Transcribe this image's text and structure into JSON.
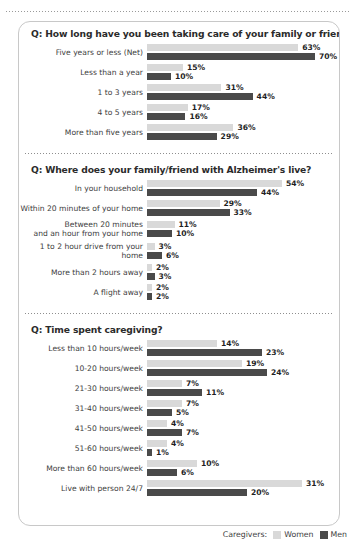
{
  "legend": {
    "prefix": "Caregivers:",
    "items": [
      {
        "label": "Women",
        "color": "#d9d9d9",
        "key": "women"
      },
      {
        "label": "Men",
        "color": "#4a4a4a",
        "key": "men"
      }
    ]
  },
  "chart_data": {
    "type": "bar",
    "title": "",
    "orientation": "horizontal",
    "series": [
      {
        "name": "Women",
        "color": "#d9d9d9"
      },
      {
        "name": "Men",
        "color": "#4a4a4a"
      }
    ],
    "legend_position": "bottom-right",
    "grid": false,
    "units": "percent",
    "sections": [
      {
        "question_prefix": "Q",
        "question": ": How long have you been taking care of your family or friend?",
        "px_per_percent": 2.4,
        "categories": [
          "Five years or less (Net)",
          "Less than a year",
          "1 to 3 years",
          "4 to 5 years",
          "More than five years"
        ],
        "women": [
          63,
          15,
          31,
          17,
          36
        ],
        "men": [
          70,
          10,
          44,
          16,
          29
        ],
        "women_labels": [
          "63%",
          "15%",
          "31%",
          "17%",
          "36%"
        ],
        "men_labels": [
          "70%",
          "10%",
          "44%",
          "16%",
          "29%"
        ]
      },
      {
        "question_prefix": "Q",
        "question": ": Where does your family/friend with Alzheimer's live?",
        "px_per_percent": 2.5,
        "categories": [
          "In your household",
          "Within 20 minutes of your home",
          "Between 20 minutes\nand an hour from your home",
          "1 to 2 hour drive from your home",
          "More than 2 hours away",
          "A flight away"
        ],
        "women": [
          54,
          29,
          11,
          3,
          2,
          2
        ],
        "men": [
          44,
          33,
          10,
          6,
          3,
          2
        ],
        "women_labels": [
          "54%",
          "29%",
          "11%",
          "3%",
          "2%",
          "2%"
        ],
        "men_labels": [
          "44%",
          "33%",
          "10%",
          "6%",
          "3%",
          "2%"
        ]
      },
      {
        "question_prefix": "Q",
        "question": ": Time spent caregiving?",
        "px_per_percent": 5.0,
        "categories": [
          "Less than 10 hours/week",
          "10-20 hours/week",
          "21-30 hours/week",
          "31-40 hours/week",
          "41-50 hours/week",
          "51-60 hours/week",
          "More than 60 hours/week",
          "Live with person 24/7"
        ],
        "women": [
          14,
          19,
          7,
          7,
          4,
          4,
          10,
          31
        ],
        "men": [
          23,
          24,
          11,
          5,
          7,
          1,
          6,
          20
        ],
        "women_labels": [
          "14%",
          "19%",
          "7%",
          "7%",
          "4%",
          "4%",
          "10%",
          "31%"
        ],
        "men_labels": [
          "23%",
          "24%",
          "11%",
          "5%",
          "7%",
          "1%",
          "6%",
          "20%"
        ]
      }
    ]
  }
}
